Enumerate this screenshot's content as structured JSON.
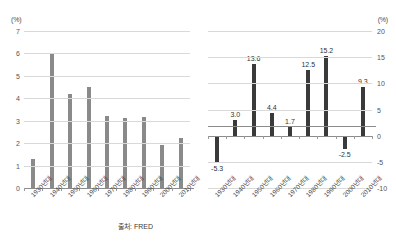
{
  "chart_data": [
    {
      "type": "bar",
      "id": "left",
      "title": "",
      "xlabel": "",
      "ylabel": "(%)",
      "unit": "(%)",
      "source": "출처: FRED",
      "ylim": [
        0,
        7
      ],
      "yticks": [
        0,
        1,
        2,
        3,
        4,
        5,
        6,
        7
      ],
      "ytick_labels": [
        "0",
        "1",
        "2",
        "3",
        "4",
        "5",
        "6",
        "7"
      ],
      "grid": true,
      "legend": "none",
      "bar_color": "#8a8a8a",
      "categories": [
        "1930년대",
        "1940년대",
        "1950년대",
        "1960년대",
        "1970년대",
        "1980년대",
        "1990년대",
        "2000년대",
        "2010년대"
      ],
      "values": [
        1.3,
        6.0,
        4.2,
        4.5,
        3.2,
        3.1,
        3.15,
        1.9,
        2.25
      ],
      "show_value_labels": false
    },
    {
      "type": "bar",
      "id": "right",
      "title": "",
      "xlabel": "",
      "ylabel": "(%)",
      "unit": "(%)",
      "source": "출처: zeninvestor",
      "ylim": [
        -10,
        20
      ],
      "yticks": [
        -10,
        -5,
        0,
        5,
        10,
        15,
        20
      ],
      "ytick_labels": [
        "-10",
        "-5",
        "0",
        "5",
        "10",
        "15",
        "20"
      ],
      "grid": true,
      "legend": "none",
      "bar_color": "#3a3a3a",
      "categories": [
        "1930년대",
        "1940년대",
        "1950년대",
        "1960년대",
        "1970년대",
        "1980년대",
        "1990년대",
        "2000년대",
        "2010년대"
      ],
      "values": [
        -5.3,
        3.0,
        13.6,
        4.4,
        1.7,
        12.5,
        15.2,
        -2.5,
        9.3
      ],
      "value_labels": [
        "-5.3",
        "3.0",
        "13.6",
        "4.4",
        "1.7",
        "12.5",
        "15.2",
        "-2.5",
        "9.3"
      ],
      "show_value_labels": true
    }
  ],
  "colors": {
    "background": "#ffffff",
    "grid": "#d9d9d9",
    "axis": "#8c8c8c",
    "text": "#3b3b3b",
    "bar_gray": "#8a8a8a",
    "bar_dark": "#3a3a3a"
  }
}
